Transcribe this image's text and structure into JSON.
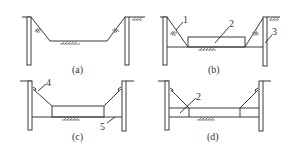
{
  "figure": {
    "subfigures": [
      {
        "id": "a",
        "caption": "(a)",
        "labels": []
      },
      {
        "id": "b",
        "caption": "(b)",
        "labels": [
          "1",
          "2",
          "3"
        ]
      },
      {
        "id": "c",
        "caption": "(c)",
        "labels": [
          "4",
          "5"
        ]
      },
      {
        "id": "d",
        "caption": "(d)",
        "labels": [
          "2"
        ]
      }
    ]
  },
  "colors": {
    "line": "#3a3a3a",
    "background": "#ffffff"
  }
}
